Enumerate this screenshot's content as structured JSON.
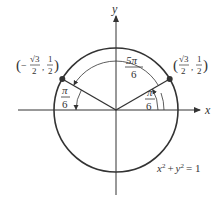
{
  "diagram": {
    "axes": {
      "x_label": "x",
      "y_label": "y"
    },
    "circle": {
      "equation": "x² + y² = 1",
      "eq_lhs_x": "x",
      "eq_lhs_y": "y",
      "eq_exp": "2",
      "eq_plus": "+",
      "eq_rhs": "= 1"
    },
    "points": [
      {
        "name": "left-point",
        "coord_label": "(−√3/2, 1/2)",
        "x_num": "√3",
        "x_den": "2",
        "x_sign": "−",
        "y_num": "1",
        "y_den": "2"
      },
      {
        "name": "right-point",
        "coord_label": "(√3/2, 1/2)",
        "x_num": "√3",
        "x_den": "2",
        "y_num": "1",
        "y_den": "2"
      }
    ],
    "angles": [
      {
        "name": "angle-5pi-6",
        "num": "5π",
        "den": "6"
      },
      {
        "name": "angle-left-pi-6",
        "num": "π",
        "den": "6"
      },
      {
        "name": "angle-right-pi-6",
        "num": "π",
        "den": "6"
      }
    ],
    "colors": {
      "stroke": "#333333",
      "background": "#ffffff"
    }
  }
}
